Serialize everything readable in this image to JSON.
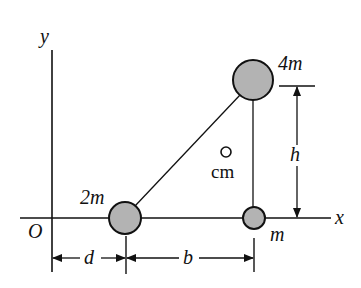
{
  "diagram": {
    "axes": {
      "x_label": "x",
      "y_label": "y",
      "origin_label": "O"
    },
    "masses": [
      {
        "id": "mass-2m",
        "label": "2m",
        "cx": 125,
        "cy": 218,
        "r": 16
      },
      {
        "id": "mass-4m",
        "label": "4m",
        "cx": 253,
        "cy": 80,
        "r": 20
      },
      {
        "id": "mass-m",
        "label": "m",
        "cx": 254,
        "cy": 218,
        "r": 11
      }
    ],
    "center_of_mass": {
      "label": "cm",
      "cx": 226,
      "cy": 152,
      "r": 5
    },
    "dimensions": {
      "d": "d",
      "b": "b",
      "h": "h"
    },
    "colors": {
      "mass_fill": "#b3b3b3",
      "stroke": "#111111"
    }
  }
}
